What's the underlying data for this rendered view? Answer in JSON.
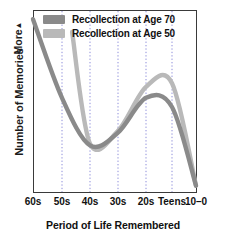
{
  "chart_data": {
    "type": "line",
    "title": "",
    "xlabel": "Period of Life Remembered",
    "ylabel": "Number of Memories",
    "y_axis_top_note": "More",
    "y_axis_arrow": "▲",
    "grid": "vertical dotted gridlines at each age tick",
    "legend_position": "top-center inside plot",
    "categories": [
      "60s",
      "50s",
      "40s",
      "30s",
      "20s",
      "Teens",
      "10–0"
    ],
    "x_tick_positions_px": [
      33,
      62,
      90,
      118,
      146,
      172,
      196
    ],
    "series": [
      {
        "name": "Recollection at Age 70",
        "color": "#8a8a8a",
        "starts_at": "60s",
        "values": [
          95,
          52,
          26,
          33,
          52,
          47,
          4
        ],
        "description": "High recency-free retention at 60s, steep decline through 50s to a trough near 40s, rising to the reminiscence bump peaking in the 20s, then falling steeply toward childhood amnesia at 10-0"
      },
      {
        "name": "Recollection at Age 50",
        "color": "#b9b9b9",
        "starts_at": "45s",
        "values": [
          null,
          88,
          27,
          34,
          58,
          60,
          4
        ],
        "description": "Begins mid-40s high, drops sharply to trough near 40s, rises to a higher reminiscence bump peaking around Teens, then falls steeply to near zero at 10-0"
      }
    ],
    "ylim": [
      0,
      100
    ],
    "y_tick_labels": []
  },
  "legend": {
    "items": [
      {
        "label": "Recollection at Age 70",
        "color": "#8a8a8a"
      },
      {
        "label": "Recollection at Age 50",
        "color": "#b9b9b9"
      }
    ]
  },
  "axes": {
    "y_more_label": "More",
    "y_more_arrow": "▲",
    "y_title": "Number of Memories",
    "x_title": "Period of Life Remembered",
    "x_ticks": [
      "60s",
      "50s",
      "40s",
      "30s",
      "20s",
      "Teens",
      "10–0"
    ]
  },
  "colors": {
    "frame": "#3a3a3a",
    "gridline": "#6b6bd0",
    "series_age70": "#8a8a8a",
    "series_age50": "#b9b9b9",
    "text": "#111111",
    "background": "#ffffff"
  }
}
